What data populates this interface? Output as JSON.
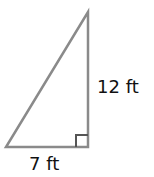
{
  "figure": {
    "shape": "right-triangle",
    "stroke_color": "#8a8a8a",
    "vertices": {
      "bottom_left": [
        6,
        147
      ],
      "right_angle": [
        88,
        147
      ],
      "top": [
        88,
        12
      ]
    },
    "right_angle_marker": "bottom-right",
    "labels": {
      "height": "12 ft",
      "base": "7 ft"
    }
  }
}
